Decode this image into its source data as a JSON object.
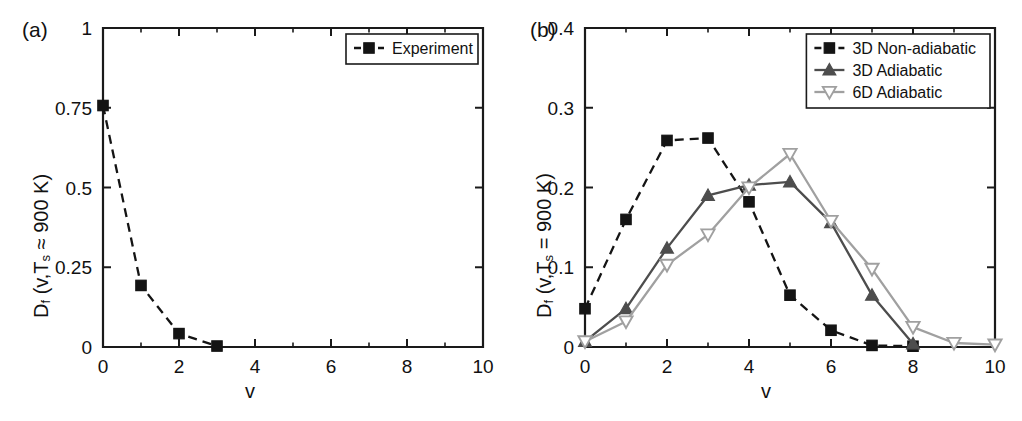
{
  "figure": {
    "panels": [
      "a",
      "b"
    ]
  },
  "panel_a": {
    "tag": "(a)",
    "xlabel": "v",
    "ylabel_prefix": "D",
    "ylabel_sub": "f",
    "ylabel_rest": " (v,T",
    "ylabel_sub2": "s",
    "ylabel_tail": " ≈ 900 K)",
    "ylabel_full": "D_f (v,T_s ≈ 900 K)",
    "legend": [
      {
        "label": "Experiment",
        "marker": "square-filled",
        "color": "#141414",
        "line": "dashed"
      }
    ]
  },
  "panel_b": {
    "tag": "(b)",
    "xlabel": "v",
    "ylabel_prefix": "D",
    "ylabel_sub": "f",
    "ylabel_rest": " (v,T",
    "ylabel_sub2": "s",
    "ylabel_tail": " = 900 K)",
    "ylabel_full": "D_f (v,T_s = 900 K)",
    "legend": [
      {
        "label": "3D Non-adiabatic",
        "marker": "square-filled",
        "color": "#141414",
        "line": "dashed"
      },
      {
        "label": "3D Adiabatic",
        "marker": "triangle-up-filled",
        "color": "#4d4d4d",
        "line": "solid"
      },
      {
        "label": "6D Adiabatic",
        "marker": "triangle-down-open",
        "color": "#a0a0a0",
        "line": "solid"
      }
    ]
  },
  "chart_data": [
    {
      "type": "line",
      "panel": "a",
      "title": "",
      "xlabel": "v",
      "ylabel": "D_f (v,T_s ≈ 900 K)",
      "xlim": [
        0,
        10
      ],
      "ylim": [
        0,
        1
      ],
      "xticks": [
        0,
        2,
        4,
        6,
        8,
        10
      ],
      "xticklabels": [
        "0",
        "2",
        "4",
        "6",
        "8",
        "10"
      ],
      "xticks_minor": [
        1,
        3,
        5,
        7,
        9
      ],
      "yticks": [
        0,
        0.25,
        0.5,
        0.75,
        1
      ],
      "yticklabels": [
        "0",
        "0.25",
        "0.5",
        "0.75",
        "1"
      ],
      "grid": false,
      "legend_position": "top-right",
      "series": [
        {
          "name": "Experiment",
          "marker": "square-filled",
          "color": "#141414",
          "linestyle": "dashed",
          "x": [
            0,
            1,
            2,
            3
          ],
          "values": [
            0.757,
            0.193,
            0.042,
            0.003
          ]
        }
      ]
    },
    {
      "type": "line",
      "panel": "b",
      "title": "",
      "xlabel": "v",
      "ylabel": "D_f (v,T_s = 900 K)",
      "xlim": [
        0,
        10
      ],
      "ylim": [
        0,
        0.4
      ],
      "xticks": [
        0,
        2,
        4,
        6,
        8,
        10
      ],
      "xticklabels": [
        "0",
        "2",
        "4",
        "6",
        "8",
        "10"
      ],
      "xticks_minor": [
        1,
        3,
        5,
        7,
        9
      ],
      "yticks": [
        0,
        0.1,
        0.2,
        0.3,
        0.4
      ],
      "yticklabels": [
        "0",
        "0.1",
        "0.2",
        "0.3",
        "0.4"
      ],
      "grid": false,
      "legend_position": "top-right",
      "series": [
        {
          "name": "3D Non-adiabatic",
          "marker": "square-filled",
          "color": "#141414",
          "linestyle": "dashed",
          "x": [
            0,
            1,
            2,
            3,
            4,
            5,
            6,
            7,
            8
          ],
          "values": [
            0.048,
            0.16,
            0.259,
            0.262,
            0.182,
            0.065,
            0.021,
            0.002,
            0.001
          ]
        },
        {
          "name": "3D Adiabatic",
          "marker": "triangle-up-filled",
          "color": "#4d4d4d",
          "linestyle": "solid",
          "x": [
            0,
            1,
            2,
            3,
            4,
            5,
            6,
            7,
            8
          ],
          "values": [
            0.007,
            0.048,
            0.124,
            0.19,
            0.203,
            0.207,
            0.156,
            0.065,
            0.004
          ]
        },
        {
          "name": "6D Adiabatic",
          "marker": "triangle-down-open",
          "color": "#a0a0a0",
          "linestyle": "solid",
          "x": [
            0,
            1,
            2,
            3,
            4,
            5,
            6,
            7,
            8,
            9,
            10
          ],
          "values": [
            0.007,
            0.032,
            0.103,
            0.141,
            0.2,
            0.242,
            0.158,
            0.098,
            0.025,
            0.005,
            0.003
          ]
        }
      ]
    }
  ]
}
